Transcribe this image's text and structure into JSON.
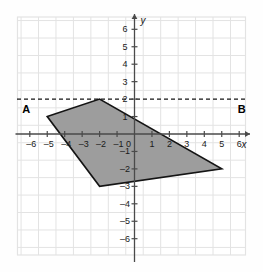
{
  "chart_data": {
    "type": "scatter",
    "title": "",
    "xlabel": "x",
    "ylabel": "y",
    "xlim": [
      -6.8,
      6.8
    ],
    "ylim": [
      -6.8,
      6.8
    ],
    "grid": true,
    "grid_step": 1,
    "legend": "none",
    "x_ticks": [
      -6,
      -5,
      -4,
      -3,
      -2,
      -1,
      0,
      1,
      2,
      3,
      4,
      5,
      6
    ],
    "x_tick_labels": [
      "–6",
      "–5",
      "–4",
      "–3",
      "–2",
      "–1",
      "0",
      "1",
      "2",
      "3",
      "4",
      "5",
      "6"
    ],
    "y_ticks": [
      6,
      5,
      4,
      3,
      2,
      1,
      -1,
      -2,
      -3,
      -4,
      -5,
      -6
    ],
    "y_tick_labels": [
      "6",
      "5",
      "4",
      "3",
      "2",
      "1",
      "–1",
      "–2",
      "–3",
      "–4",
      "–5",
      "–6"
    ],
    "origin_label": "0",
    "shapes": [
      {
        "name": "shaded-quadrilateral",
        "kind": "polygon",
        "vertices": [
          [
            -5,
            1
          ],
          [
            -2,
            2
          ],
          [
            5,
            -2
          ],
          [
            -2,
            -3
          ]
        ],
        "fill": "#9d9d9d",
        "stroke": "#141414",
        "stroke_width": 1.6
      },
      {
        "name": "dashed-line-AB",
        "kind": "dashed-horizontal-line",
        "y": 2,
        "x_from": -6.8,
        "x_to": 6.8,
        "stroke": "#141414",
        "dash": "4 3"
      }
    ],
    "annotations": [
      {
        "name": "label-A",
        "text": "A",
        "x": -6.2,
        "y": 1.45
      },
      {
        "name": "label-B",
        "text": "B",
        "x": 6.15,
        "y": 1.45
      }
    ]
  },
  "axes": {
    "x_axis_name": "x",
    "y_axis_name": "y"
  },
  "colors": {
    "fill": "#9d9d9d",
    "stroke": "#141414",
    "grid": "#e3e3e3",
    "axis": "#4a4a4a",
    "background": "#fefefe"
  }
}
